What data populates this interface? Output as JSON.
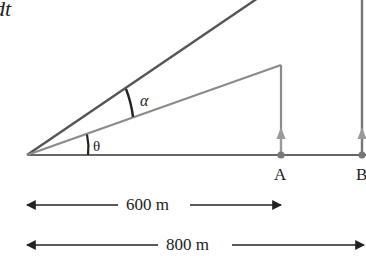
{
  "diagram": {
    "fragment_text": "dt",
    "fragment_dot": "·",
    "angles": {
      "theta": "θ",
      "alpha": "α"
    },
    "points": {
      "A": "A",
      "B": "B"
    },
    "distances": {
      "short": "600 m",
      "long": "800 m"
    },
    "colors": {
      "dark_line": "#555555",
      "light_line": "#8a8a8a",
      "ground_line": "#666666",
      "text": "#222222"
    }
  }
}
